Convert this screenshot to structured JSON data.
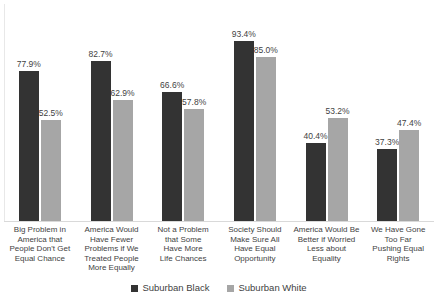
{
  "chart_data": {
    "type": "bar",
    "title": "",
    "subtitle": "",
    "xlabel": "",
    "ylabel": "",
    "ylim": [
      0,
      100
    ],
    "grid": false,
    "legend_position": "bottom",
    "categories": [
      "Big Problem in America that People Don't Get Equal Chance",
      "America Would Have Fewer Problems if We Treated People More Equally",
      "Not a Problem that Some Have More Life Chances",
      "Society Should Make Sure All Have Equal Opportunity",
      "America Would Be Better if Worried Less about Equality",
      "We Have Gone Too Far Pushing Equal Rights"
    ],
    "category_lines": [
      [
        "Big Problem in",
        "America that",
        "People Don't Get",
        "Equal Chance"
      ],
      [
        "America Would",
        "Have Fewer",
        "Problems if We",
        "Treated People",
        "More Equally"
      ],
      [
        "Not a Problem",
        "that  Some",
        "Have More",
        "Life Chances"
      ],
      [
        "Society Should",
        "Make Sure All",
        "Have Equal",
        "Opportunity"
      ],
      [
        "America Would Be",
        "Better if Worried",
        "Less about",
        "Equality"
      ],
      [
        "We Have Gone",
        "Too Far",
        "Pushing Equal",
        "Rights"
      ]
    ],
    "series": [
      {
        "name": "Suburban Black",
        "color": "#333333",
        "values": [
          77.9,
          82.7,
          66.6,
          93.4,
          40.4,
          37.3
        ],
        "labels": [
          "77.9%",
          "82.7%",
          "66.6%",
          "93.4%",
          "40.4%",
          "37.3%"
        ]
      },
      {
        "name": "Suburban White",
        "color": "#a6a6a6",
        "values": [
          52.5,
          62.9,
          57.8,
          85.0,
          53.2,
          47.4
        ],
        "labels": [
          "52.5%",
          "62.9%",
          "57.8%",
          "85.0%",
          "53.2%",
          "47.4%"
        ]
      }
    ]
  },
  "legend": {
    "items": [
      {
        "label": "Suburban Black",
        "color": "#333333"
      },
      {
        "label": "Suburban White",
        "color": "#a6a6a6"
      }
    ]
  }
}
